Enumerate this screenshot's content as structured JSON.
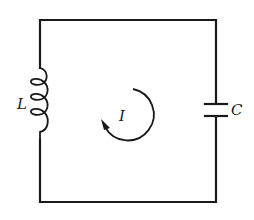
{
  "diagram": {
    "type": "LC circuit",
    "components": {
      "inductor": {
        "label": "L"
      },
      "capacitor": {
        "label": "C"
      }
    },
    "current": {
      "label": "I",
      "direction": "clockwise"
    },
    "colors": {
      "ink": "#1a1a1a",
      "background": "#ffffff"
    }
  }
}
